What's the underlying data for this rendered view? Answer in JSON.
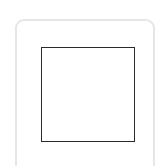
{
  "icon": {
    "name": "maximize-square-icon",
    "frame_color": "#e6e6e6",
    "square_color": "#2a2a2a",
    "background": "#ffffff"
  }
}
